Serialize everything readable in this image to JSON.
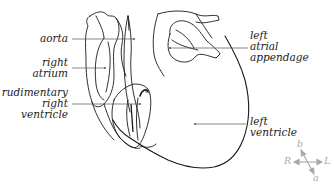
{
  "diagram": {
    "labels": {
      "aorta": "aorta",
      "right_atrium": [
        "right",
        "atrium"
      ],
      "rudimentary_right_ventricle": [
        "rudimentary",
        "right",
        "ventricle"
      ],
      "left_atrial_appendage": [
        "left",
        "atrial",
        "appendage"
      ],
      "left_ventricle": [
        "left",
        "ventricle"
      ]
    },
    "compass": {
      "left": "R",
      "right": "L",
      "top": "b",
      "bottom": "a"
    },
    "colors": {
      "line": "#1a1a1a",
      "leader": "#555555",
      "compass": "#a8a8a8"
    }
  }
}
